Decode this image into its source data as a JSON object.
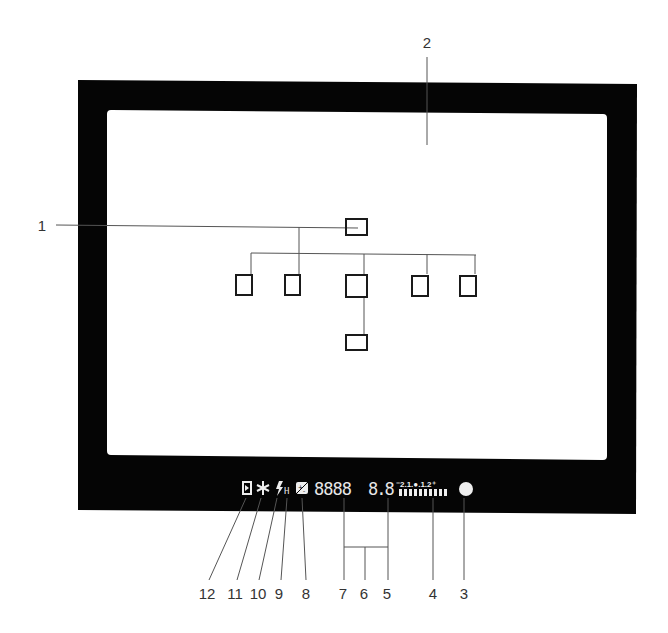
{
  "diagram": {
    "colors": {
      "frame": "#050505",
      "screen": "#ffffff",
      "leader_line": "#555555",
      "af_box": "#1a1a1a",
      "lcd": "#eeeeee",
      "label": "#333333"
    },
    "callouts": {
      "c1": "1",
      "c2": "2",
      "c3": "3",
      "c4": "4",
      "c5": "5",
      "c6": "6",
      "c7": "7",
      "c8": "8",
      "c9": "9",
      "c10": "10",
      "c11": "11",
      "c12": "12"
    },
    "focus_areas": [
      {
        "id": "top",
        "shape": "wide"
      },
      {
        "id": "far-left",
        "shape": "tall"
      },
      {
        "id": "left",
        "shape": "tall"
      },
      {
        "id": "center",
        "shape": "square"
      },
      {
        "id": "right",
        "shape": "tall"
      },
      {
        "id": "far-right",
        "shape": "tall"
      },
      {
        "id": "bottom",
        "shape": "wide"
      }
    ],
    "lcd": {
      "icon_12": "d-frame-icon",
      "icon_11": "asterisk-icon",
      "icon_10": "flash-bolt-icon",
      "icon_9_text": "H",
      "icon_8": "exposure-compensation-icon",
      "shutter_digits": "8888",
      "aperture_digits": "8.8",
      "scale_text": "⁻2.1.●.1.2⁺",
      "indicator_3": "in-focus-dot-icon"
    }
  }
}
